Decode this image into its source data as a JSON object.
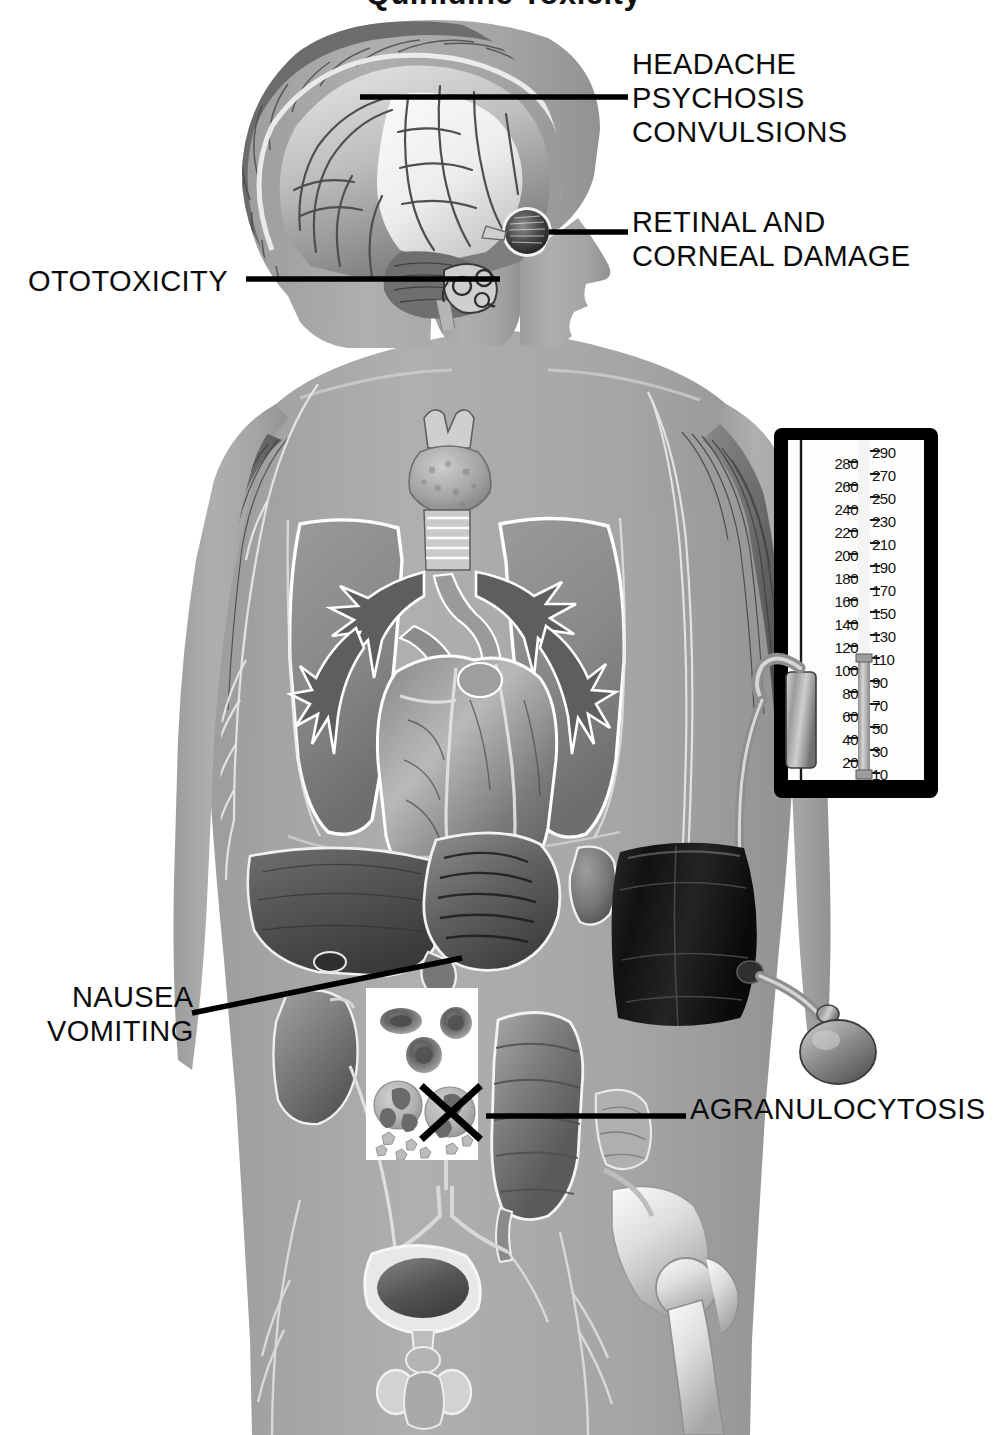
{
  "figure": {
    "title": "Quinidine Toxicity",
    "title_note": "top-cropped heading",
    "style": "grayscale medical airbrush illustration",
    "background_color": "#ffffff",
    "body_silhouette_color": "#a8a8a8",
    "label_color": "#0b0b0b",
    "leader_line_color": "#000000"
  },
  "callouts": [
    {
      "id": "cerebral",
      "name": "cerebral-effects",
      "lines": [
        "HEADACHE",
        "PSYCHOSIS",
        "CONVULSIONS"
      ],
      "points_to": "brain",
      "side": "right"
    },
    {
      "id": "ocular",
      "name": "ocular-effects",
      "lines": [
        "RETINAL AND",
        "CORNEAL DAMAGE"
      ],
      "points_to": "eyeball",
      "side": "right"
    },
    {
      "id": "ototoxicity",
      "name": "auditory-effects",
      "lines": [
        "OTOTOXICITY"
      ],
      "points_to": "inner ear cochlea",
      "side": "left"
    },
    {
      "id": "gastrointestinal",
      "name": "gastrointestinal-effects",
      "lines": [
        "NAUSEA",
        "VOMITING"
      ],
      "points_to": "stomach and pylorus",
      "side": "left"
    },
    {
      "id": "hematologic",
      "name": "hematologic-effects",
      "lines": [
        "AGRANULOCYTOSIS"
      ],
      "points_to": "blood cell inset, crossed-out granulocyte",
      "side": "right"
    }
  ],
  "manometer": {
    "name": "mercury-sphygmomanometer",
    "units": "mmHg",
    "scale_left": [
      280,
      260,
      240,
      220,
      200,
      180,
      160,
      140,
      120,
      100,
      80,
      60,
      40,
      20
    ],
    "scale_right": [
      290,
      270,
      250,
      230,
      210,
      190,
      170,
      150,
      130,
      110,
      90,
      70,
      50,
      30,
      10
    ],
    "mercury_level": 110,
    "frame_color": "#000000",
    "face_color": "#fdfdfb",
    "mercury_color": "#bdbdbd"
  },
  "cuff": {
    "name": "blood-pressure-cuff",
    "location": "left upper arm",
    "color": "#1a1a1a",
    "bulb_label": "inflation bulb",
    "tubing_label": "rubber tubing"
  },
  "blood_inset": {
    "name": "blood-smear-inset",
    "background": "#ffffff",
    "cells": [
      {
        "type": "erythrocyte",
        "count": 3,
        "label": "red blood cell"
      },
      {
        "type": "granulocyte",
        "count": 1,
        "label": "normal granulocyte"
      },
      {
        "type": "granulocyte-destroyed",
        "count": 1,
        "label": "granulocyte marked with X"
      },
      {
        "type": "platelets",
        "count": 7,
        "label": "platelet fragments"
      }
    ],
    "marker": "X"
  },
  "anatomy": {
    "head": [
      "scalp hair",
      "cerebrum",
      "cerebellum",
      "brainstem",
      "inner ear cochlea",
      "eyeball",
      "optic nerve"
    ],
    "neck_thorax": [
      "thyroid gland",
      "trachea",
      "bronchi",
      "right lung",
      "left lung",
      "heart",
      "aorta",
      "pulmonary artery"
    ],
    "abdomen": [
      "liver",
      "gallbladder",
      "stomach",
      "spleen",
      "kidney",
      "ureter",
      "colon",
      "small intestine"
    ],
    "pelvis": [
      "bladder",
      "prostate",
      "testes",
      "pelvic bone",
      "femur",
      "hip joint",
      "lumbar nerves"
    ],
    "limbs": [
      "deltoid muscle",
      "pectoral muscle",
      "brachial nerves",
      "arm"
    ]
  }
}
